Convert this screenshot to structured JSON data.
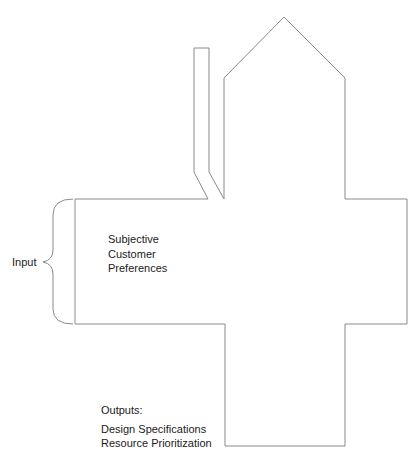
{
  "diagram": {
    "type": "house-of-quality-outline",
    "input_label": "Input",
    "center_text": [
      "Subjective",
      "Customer",
      "Preferences"
    ],
    "outputs": {
      "heading": "Outputs:",
      "items": [
        "Design Specifications",
        "Resource Prioritization"
      ]
    },
    "colors": {
      "line": "#8a8a8a",
      "text": "#1a1a1a",
      "background": "#ffffff"
    }
  }
}
